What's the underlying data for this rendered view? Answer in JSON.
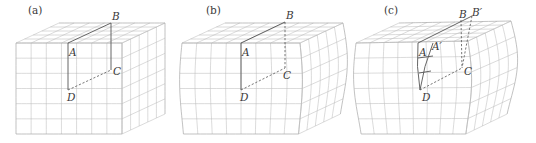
{
  "figure": {
    "panels": [
      {
        "id": "a",
        "label": "(a)",
        "label_pos": [
          28,
          14
        ],
        "front": {
          "x0": 16,
          "y0": 43,
          "x1": 122,
          "y1": 134,
          "cols": 7,
          "rows": 6
        },
        "depth": {
          "dx": 43,
          "dy": -20,
          "cells": 5
        },
        "deform": "none",
        "points": {
          "A": {
            "text": "A",
            "xy": [
              68,
              43
            ],
            "lbl": [
              69,
              56
            ]
          },
          "B": {
            "text": "B",
            "xy": [
              111,
              23
            ],
            "lbl": [
              112,
              20
            ]
          },
          "C": {
            "text": "C",
            "xy": [
              111,
              70
            ],
            "lbl": [
              113,
              75
            ]
          },
          "D": {
            "text": "D",
            "xy": [
              68,
              90
            ],
            "lbl": [
              67,
              101
            ]
          }
        },
        "lines": [
          {
            "from": "A",
            "to": "B",
            "style": "solid"
          },
          {
            "from": "B",
            "to": "C",
            "style": "solid"
          },
          {
            "from": "A",
            "to": "D",
            "style": "solid"
          },
          {
            "from": "D",
            "to": "C",
            "style": "dashed"
          }
        ]
      },
      {
        "id": "b",
        "label": "(b)",
        "label_pos": [
          206,
          14
        ],
        "front": {
          "x0": 182,
          "y0": 43,
          "x1": 300,
          "y1": 134,
          "cols": 8,
          "rows": 6
        },
        "depth": {
          "dx": 43,
          "dy": -20,
          "cells": 5
        },
        "deform": "wave",
        "points": {
          "A": {
            "text": "A",
            "xy": [
              241,
              43
            ],
            "lbl": [
              242,
              56
            ]
          },
          "B": {
            "text": "B",
            "xy": [
              285,
              22
            ],
            "lbl": [
              286,
              19
            ]
          },
          "C": {
            "text": "C",
            "xy": [
              285,
              68
            ],
            "lbl": [
              283,
              79
            ]
          },
          "D": {
            "text": "D",
            "xy": [
              241,
              90
            ],
            "lbl": [
              240,
              101
            ]
          }
        },
        "lines": [
          {
            "from": "A",
            "to": "B",
            "style": "solid"
          },
          {
            "from": "B",
            "to": "C",
            "style": "dashed"
          },
          {
            "from": "A",
            "to": "D",
            "style": "solid"
          },
          {
            "from": "D",
            "to": "C",
            "style": "dashed"
          }
        ]
      },
      {
        "id": "c",
        "label": "(c)",
        "label_pos": [
          384,
          14
        ],
        "front": {
          "x0": 359,
          "y0": 43,
          "x1": 468,
          "y1": 134,
          "cols": 8,
          "rows": 6
        },
        "depth": {
          "dx": 43,
          "dy": -20,
          "cells": 5
        },
        "deform": "wave-strong",
        "points": {
          "A": {
            "text": "A",
            "xy": [
              418,
              43
            ],
            "lbl": [
              419,
              56
            ]
          },
          "A'": {
            "text": "A′",
            "xy": [
              433,
              43
            ],
            "lbl": [
              432,
              50
            ]
          },
          "B": {
            "text": "B",
            "xy": [
              461,
              20
            ],
            "lbl": [
              459,
              18
            ]
          },
          "B'": {
            "text": "B′",
            "xy": [
              472,
              16
            ],
            "lbl": [
              472,
              16
            ]
          },
          "C": {
            "text": "C",
            "xy": [
              462,
              68
            ],
            "lbl": [
              464,
              75
            ]
          },
          "D": {
            "text": "D",
            "xy": [
              420,
              90
            ],
            "lbl": [
              422,
              101
            ]
          }
        },
        "lines": [
          {
            "from": "A",
            "to": "B'",
            "style": "solid"
          },
          {
            "from": "A",
            "to": "D",
            "style": "solid-curve"
          },
          {
            "from": "A'",
            "to": "D",
            "style": "solid-curve"
          },
          {
            "from": "D",
            "to": "C",
            "style": "dashed"
          },
          {
            "from": "B",
            "to": "C",
            "style": "dashed"
          },
          {
            "from": "B'",
            "to": "C",
            "style": "dashed"
          }
        ]
      }
    ]
  }
}
